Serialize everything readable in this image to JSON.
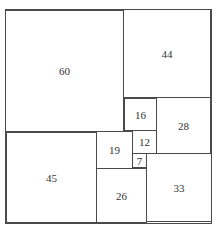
{
  "diagram": {
    "type": "squared-rectangle",
    "squares": [
      {
        "label": "60",
        "x": 5,
        "y": 10,
        "w": 119,
        "h": 122
      },
      {
        "label": "44",
        "x": 123,
        "y": 9,
        "w": 88,
        "h": 89
      },
      {
        "label": "16",
        "x": 124,
        "y": 98,
        "w": 33,
        "h": 33
      },
      {
        "label": "28",
        "x": 156,
        "y": 97,
        "w": 55,
        "h": 57
      },
      {
        "label": "12",
        "x": 132,
        "y": 130,
        "w": 25,
        "h": 24
      },
      {
        "label": "19",
        "x": 96,
        "y": 131,
        "w": 37,
        "h": 38
      },
      {
        "label": "7",
        "x": 132,
        "y": 153,
        "w": 15,
        "h": 15
      },
      {
        "label": "45",
        "x": 6,
        "y": 132,
        "w": 91,
        "h": 91
      },
      {
        "label": "26",
        "x": 96,
        "y": 168,
        "w": 51,
        "h": 55
      },
      {
        "label": "33",
        "x": 146,
        "y": 153,
        "w": 66,
        "h": 69
      }
    ]
  }
}
